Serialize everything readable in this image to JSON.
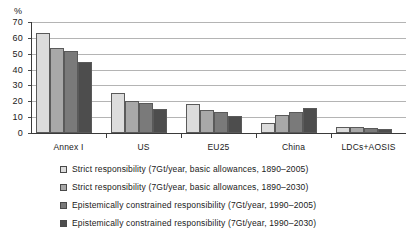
{
  "chart_data": {
    "type": "bar",
    "title": "",
    "xlabel": "",
    "ylabel": "%",
    "ylim": [
      0,
      70
    ],
    "ytick_step": 10,
    "yticks": [
      0,
      10,
      20,
      30,
      40,
      50,
      60,
      70
    ],
    "grid": true,
    "legend_position": "below",
    "categories": [
      "Annex I",
      "US",
      "EU25",
      "China",
      "LDCs+AOSIS"
    ],
    "series": [
      {
        "name": "Strict responsibility (7Gt/year, basic allowances, 1890–2005)",
        "color": "#dcdcdc",
        "values": [
          63,
          25,
          18,
          6,
          4
        ]
      },
      {
        "name": "Strict responsibility (7Gt/year, basic allowances, 1890–2030)",
        "color": "#a8a8a8",
        "values": [
          53.5,
          20,
          14.5,
          11.5,
          3.5
        ]
      },
      {
        "name": "Epistemically constrained responsibility (7Gt/year, 1990–2005)",
        "color": "#7a7a7a",
        "values": [
          52,
          19,
          13,
          13,
          3
        ]
      },
      {
        "name": "Epistemically constrained responsibility (7Gt/year, 1990–2030)",
        "color": "#4d4d4d",
        "values": [
          44.5,
          15,
          11,
          16,
          2.5
        ]
      }
    ]
  },
  "axis": {
    "unit_label": "%"
  },
  "colors": {
    "series_1": "#dcdcdc",
    "series_2": "#a8a8a8",
    "series_3": "#7a7a7a",
    "series_4": "#4d4d4d",
    "gridline": "#b4b4b4",
    "axis": "#3a3a3a",
    "background": "#ffffff"
  }
}
